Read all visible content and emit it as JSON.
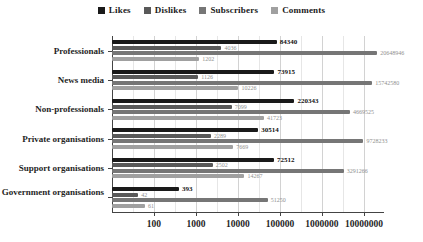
{
  "chart_data": {
    "type": "bar",
    "orientation": "horizontal",
    "xscale": "log",
    "xlim": [
      10,
      30000000
    ],
    "xticks": [
      100,
      1000,
      10000,
      100000,
      1000000,
      10000000
    ],
    "grid": "on",
    "legend_position": "top-center",
    "categories": [
      "Professionals",
      "News media",
      "Non-professionals",
      "Private organisations",
      "Support organisations",
      "Government organisations"
    ],
    "series": [
      {
        "name": "Likes",
        "color": "#1a1a1a",
        "values": [
          84340,
          73915,
          220343,
          30514,
          72512,
          393
        ]
      },
      {
        "name": "Dislikes",
        "color": "#595959",
        "values": [
          4036,
          1126,
          7099,
          2289,
          2502,
          42
        ]
      },
      {
        "name": "Subscribers",
        "color": "#767676",
        "values": [
          20648946,
          15742580,
          4669525,
          9728233,
          3291266,
          51250
        ]
      },
      {
        "name": "Comments",
        "color": "#a0a0a0",
        "values": [
          1202,
          10226,
          41723,
          7669,
          14267,
          61
        ]
      }
    ]
  }
}
